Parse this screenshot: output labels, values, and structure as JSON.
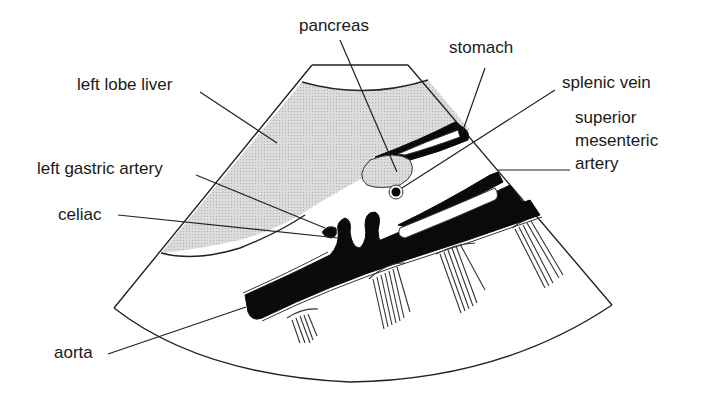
{
  "diagram": {
    "type": "ultrasound-transverse-sector",
    "colors": {
      "liver_fill": "#d4d4d4",
      "vessel_fill": "#0a0a0a",
      "outline": "#222222",
      "background": "#ffffff"
    },
    "labels": {
      "pancreas": "pancreas",
      "stomach": "stomach",
      "left_lobe_liver": "left lobe liver",
      "splenic_vein": "splenic vein",
      "superior_line1": "superior",
      "superior_line2": "mesenteric",
      "superior_line3": "artery",
      "left_gastric_artery": "left gastric artery",
      "celiac": "celiac",
      "aorta": "aorta"
    }
  }
}
